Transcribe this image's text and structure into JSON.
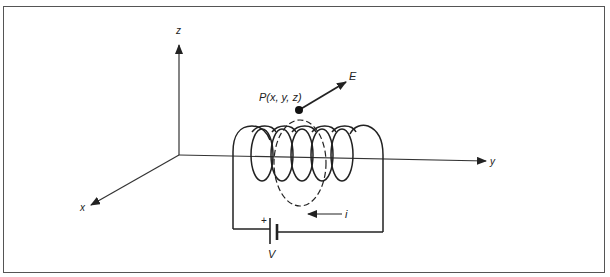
{
  "figure": {
    "axes": {
      "z_label": "z",
      "y_label": "y",
      "x_label": "x"
    },
    "point": {
      "label": "P(x, y, z)"
    },
    "vector": {
      "label": "E"
    },
    "circuit": {
      "current_label": "i",
      "battery_label": "V",
      "battery_polarity": "+"
    },
    "colors": {
      "line": "#222222",
      "border": "#555555",
      "background": "#ffffff"
    }
  }
}
